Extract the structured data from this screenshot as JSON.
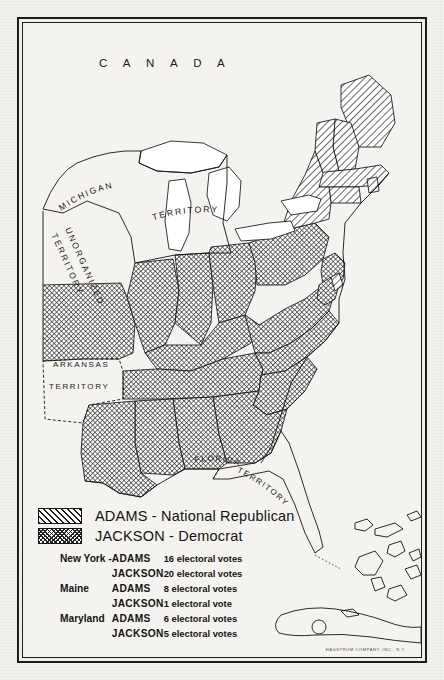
{
  "map": {
    "country_label": "C A N A D A",
    "territories": [
      {
        "name": "MICHIGAN",
        "id": "michigan-territory"
      },
      {
        "name": "TERRITORY",
        "id": "michigan-territory-word2"
      },
      {
        "name": "UNORGANIZED",
        "id": "unorganized-territory"
      },
      {
        "name": "TERRITORY",
        "id": "unorganized-territory-word2"
      },
      {
        "name": "ARKANSAS",
        "id": "arkansas-territory"
      },
      {
        "name": "TERRITORY",
        "id": "arkansas-territory-word2"
      },
      {
        "name": "FLORIDA",
        "id": "florida-territory"
      },
      {
        "name": "TERRITORY",
        "id": "florida-territory-word2"
      }
    ],
    "labels": {
      "canada": "C A N A D A",
      "michigan_1": "MICHIGAN",
      "michigan_2": "TERRITORY",
      "unorganized_1": "UNORGANIZED",
      "unorganized_2": "TERRITORY",
      "arkansas_1": "ARKANSAS",
      "arkansas_2": "TERRITORY",
      "florida_1": "FLORIDA",
      "florida_2": "TERRITORY"
    },
    "colors": {
      "paper": "#f2f1ed",
      "ink": "#1a1a1a",
      "adams_fill": "#cfcfcf",
      "jackson_fill": "#9a9a9a",
      "water": "#ffffff"
    }
  },
  "legend": {
    "keys": [
      {
        "pattern": "diagonal-hatch",
        "label": "ADAMS - National Republican"
      },
      {
        "pattern": "cross-hatch",
        "label": "JACKSON - Democrat"
      }
    ],
    "split_votes": [
      {
        "state": "New York -",
        "candidate": "ADAMS",
        "votes": "16 electoral votes"
      },
      {
        "state": "",
        "candidate": "JACKSON",
        "votes": "20 electoral votes"
      },
      {
        "state": "Maine",
        "candidate": "ADAMS",
        "votes": "8 electoral votes"
      },
      {
        "state": "",
        "candidate": "JACKSON",
        "votes": "1 electoral vote"
      },
      {
        "state": "Maryland",
        "candidate": "ADAMS",
        "votes": "6 electoral votes"
      },
      {
        "state": "",
        "candidate": "JACKSON",
        "votes": "5 electoral votes"
      }
    ]
  },
  "credit": "HAGSTROM COMPANY, INC., N.Y."
}
